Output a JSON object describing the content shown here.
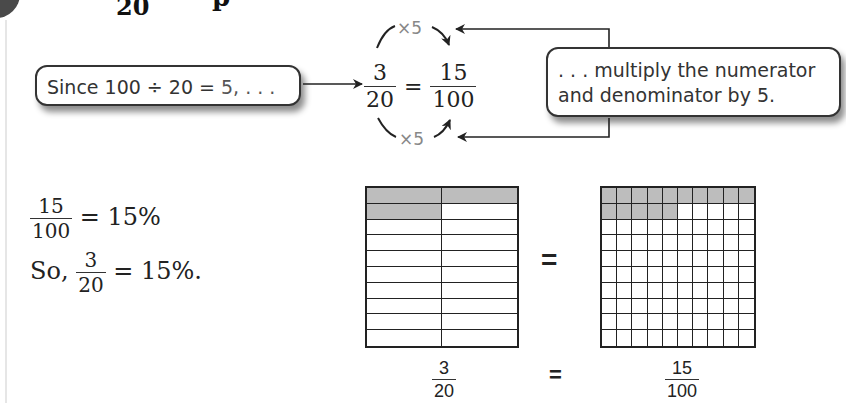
{
  "header": {
    "title_fragment_denominator": "20",
    "title_fragment_letter": "p"
  },
  "callouts": {
    "left_prefix": "Since 100 ÷ 20 = ",
    "left_highlight": "5, . . .",
    "right_line1": ". . . multiply the numerator",
    "right_line2": "and denominator by 5."
  },
  "equation": {
    "frac1": {
      "num": "3",
      "den": "20"
    },
    "equals": "=",
    "frac2": {
      "num": "15",
      "den": "100"
    },
    "top_multiplier": "×5",
    "bottom_multiplier": "×5"
  },
  "work": {
    "line1": {
      "frac": {
        "num": "15",
        "den": "100"
      },
      "rest": " = 15%"
    },
    "line2": {
      "prefix": "So, ",
      "frac": {
        "num": "3",
        "den": "20"
      },
      "rest": " = 15%."
    }
  },
  "models": {
    "left_grid": {
      "cols": 2,
      "rows": 10,
      "shaded": 3
    },
    "right_grid": {
      "cols": 10,
      "rows": 10,
      "shaded": 15
    },
    "shade_color": "#bdbdbd",
    "equals": "=",
    "label_left": {
      "num": "3",
      "den": "20"
    },
    "label_equals": "=",
    "label_right": {
      "num": "15",
      "den": "100"
    }
  }
}
